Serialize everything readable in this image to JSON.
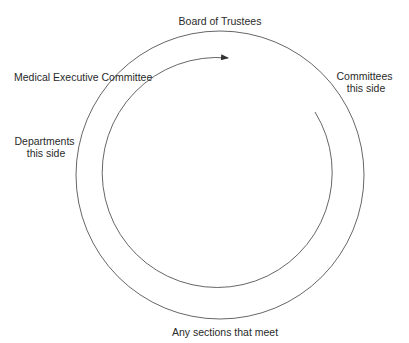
{
  "diagram": {
    "type": "cycle",
    "labels": {
      "top": "Board of Trustees",
      "upper_left": "Medical Executive Committee",
      "right": [
        "Committees",
        "this side"
      ],
      "left": [
        "Departments",
        "this side"
      ],
      "bottom": "Any sections that meet"
    },
    "flow_direction": "clockwise",
    "colors": {
      "line": "#555555",
      "text": "#2a2a2a",
      "background": "#ffffff"
    }
  }
}
